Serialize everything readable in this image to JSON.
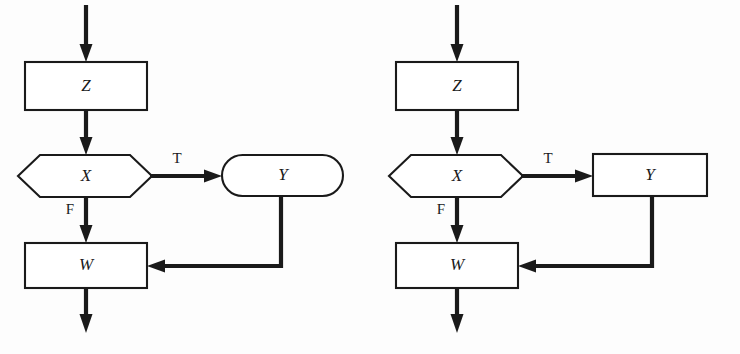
{
  "figure": {
    "kind": "flowchart-pair",
    "background_color": "#fdfdfd",
    "line_color": "#1a1a1a",
    "node_fill": "#ffffff"
  },
  "diagrams": [
    {
      "id": "left",
      "x_offset": 0,
      "nodes": {
        "z": {
          "label": "Z",
          "shape": "rectangle"
        },
        "x": {
          "label": "X",
          "shape": "hexagon"
        },
        "y": {
          "label": "Y",
          "shape": "stadium"
        },
        "w": {
          "label": "W",
          "shape": "rectangle"
        }
      },
      "edges": {
        "entry": {
          "label": ""
        },
        "z_to_x": {
          "label": ""
        },
        "x_true": {
          "label": "T"
        },
        "x_false": {
          "label": "F"
        },
        "y_to_w": {
          "label": ""
        },
        "exit": {
          "label": ""
        }
      }
    },
    {
      "id": "right",
      "x_offset": 371,
      "nodes": {
        "z": {
          "label": "Z",
          "shape": "rectangle"
        },
        "x": {
          "label": "X",
          "shape": "hexagon"
        },
        "y": {
          "label": "Y",
          "shape": "rectangle"
        },
        "w": {
          "label": "W",
          "shape": "rectangle"
        }
      },
      "edges": {
        "entry": {
          "label": ""
        },
        "z_to_x": {
          "label": ""
        },
        "x_true": {
          "label": "T"
        },
        "x_false": {
          "label": "F"
        },
        "y_to_w": {
          "label": ""
        },
        "exit": {
          "label": ""
        }
      }
    }
  ]
}
